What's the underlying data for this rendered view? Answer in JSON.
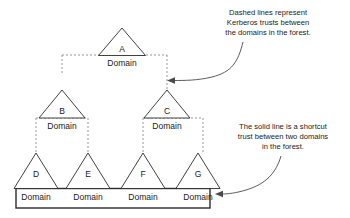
{
  "diagram": {
    "domain_label": "Domain",
    "nodes": [
      {
        "id": "A",
        "label": "A",
        "domain": "Domain",
        "level": 0
      },
      {
        "id": "B",
        "label": "B",
        "domain": "Domain",
        "level": 1
      },
      {
        "id": "C",
        "label": "C",
        "domain": "Domain",
        "level": 1
      },
      {
        "id": "D",
        "label": "D",
        "domain": "Domain",
        "level": 2
      },
      {
        "id": "E",
        "label": "E",
        "domain": "Domain",
        "level": 2
      },
      {
        "id": "F",
        "label": "F",
        "domain": "Domain",
        "level": 2
      },
      {
        "id": "G",
        "label": "G",
        "domain": "Domain",
        "level": 2
      }
    ],
    "annotations": [
      {
        "id": "dashed-note",
        "lines": [
          "Dashed lines represent",
          "Kerberos trusts between",
          "the domains in the forest."
        ]
      },
      {
        "id": "solid-note",
        "lines": [
          "The solid line is a shortcut",
          "trust between two domains",
          "in the forest."
        ]
      }
    ],
    "colors": {
      "outline": "#2b2b2b",
      "dashed": "#8c8c8c",
      "arrow": "#4a4a4a",
      "text": "#1a1a1a",
      "background": "#ffffff"
    }
  }
}
